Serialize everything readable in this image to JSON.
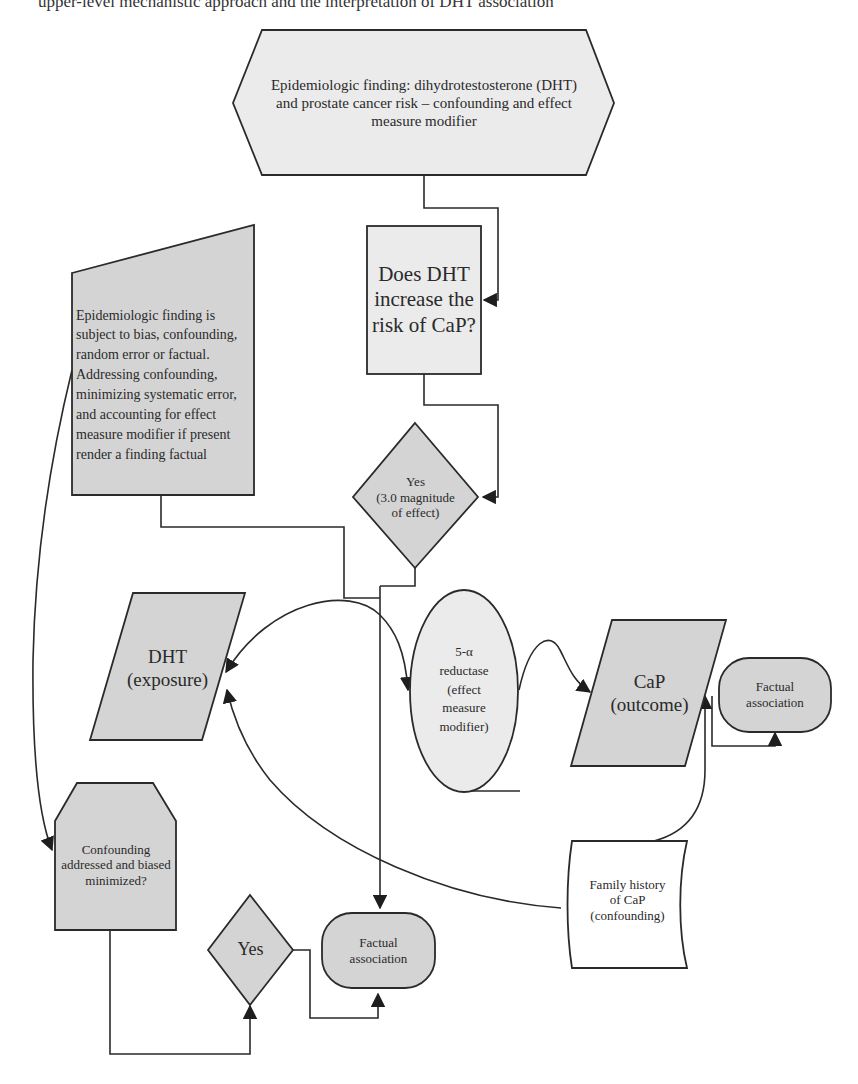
{
  "caption": "upper-level mechanistic approach and the interpretation of DHT association",
  "colors": {
    "shape_fill_gray": "#d4d4d4",
    "shape_fill_light": "#ebebeb",
    "stroke": "#2a2a2a",
    "background": "#ffffff"
  },
  "nodes": {
    "top_finding": {
      "shape": "hexagon",
      "text": "Epidemiologic finding: dihydrotestosterone (DHT) and prostate cancer risk – confounding and effect measure modifier"
    },
    "question": {
      "shape": "rectangle",
      "text": "Does DHT increase the risk of CaP?"
    },
    "bias_note": {
      "shape": "manual-input",
      "text": "Epidemiologic finding is subject to bias, confounding, random error or factual. Addressing confounding, minimizing systematic error, and accounting for effect measure modifier if present render a finding factual"
    },
    "yes_magnitude": {
      "shape": "diamond",
      "line1": "Yes",
      "line2": "(3.0 magnitude",
      "line3": "of effect)"
    },
    "dht_exposure": {
      "shape": "parallelogram",
      "line1": "DHT",
      "line2": "(exposure)"
    },
    "reductase": {
      "shape": "ellipse",
      "line1": "5-α",
      "line2": "reductase",
      "line3": "(effect",
      "line4": "measure",
      "line5": "modifier)"
    },
    "cap_outcome": {
      "shape": "parallelogram",
      "line1": "CaP",
      "line2": "(outcome)"
    },
    "factual_right": {
      "shape": "terminator",
      "line1": "Factual",
      "line2": "association"
    },
    "confounding_check": {
      "shape": "loop-limit",
      "text": "Confounding addressed and biased minimized?"
    },
    "yes_bottom": {
      "shape": "diamond",
      "text": "Yes"
    },
    "factual_bottom": {
      "shape": "terminator",
      "line1": "Factual",
      "line2": "association"
    },
    "family_history": {
      "shape": "card",
      "line1": "Family history",
      "line2": "of CaP",
      "line3": "(confounding)"
    }
  },
  "edges": [
    {
      "from": "top_finding",
      "to": "question"
    },
    {
      "from": "question",
      "to": "yes_magnitude"
    },
    {
      "from": "yes_magnitude",
      "to": "factual_bottom"
    },
    {
      "from": "bias_note",
      "to": "factual_bottom"
    },
    {
      "from": "dht_exposure",
      "to": "reductase"
    },
    {
      "from": "reductase",
      "to": "cap_outcome"
    },
    {
      "from": "cap_outcome",
      "to": "factual_right"
    },
    {
      "from": "family_history",
      "to": "dht_exposure"
    },
    {
      "from": "family_history",
      "to": "cap_outcome"
    },
    {
      "from": "bias_note",
      "to": "confounding_check"
    },
    {
      "from": "confounding_check",
      "to": "yes_bottom"
    },
    {
      "from": "yes_bottom",
      "to": "factual_bottom"
    }
  ]
}
